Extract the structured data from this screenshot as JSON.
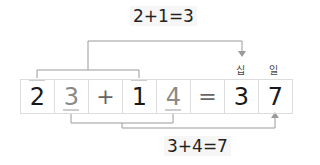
{
  "top_equation": "2+1=3",
  "bottom_equation": "3+4=7",
  "cells": [
    {
      "value": "2",
      "style": "dark"
    },
    {
      "value": "3",
      "style": "grey"
    },
    {
      "value": "+",
      "style": "op"
    },
    {
      "value": "1",
      "style": "dark"
    },
    {
      "value": "4",
      "style": "grey"
    },
    {
      "value": "=",
      "style": "op"
    },
    {
      "value": "3",
      "style": "dark"
    },
    {
      "value": "7",
      "style": "dark"
    }
  ],
  "place_labels": {
    "tens": "십",
    "ones": "일"
  },
  "colors": {
    "line": "#9a9a9a",
    "grid": "#dcdcdc",
    "dark_digit": "#1a1a1a",
    "grey_digit": "#8a8a8a"
  }
}
